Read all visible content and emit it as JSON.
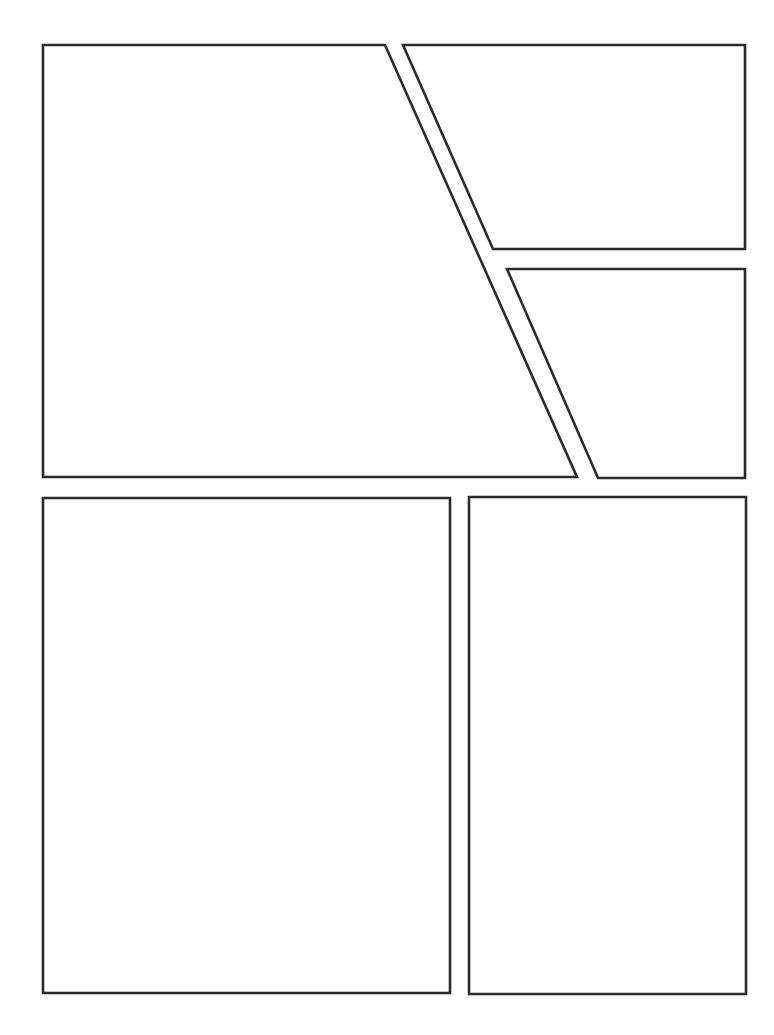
{
  "page": {
    "width": 774,
    "height": 1035,
    "background": "#ffffff",
    "border_color": "#2b2b2b",
    "panel_count": 5
  },
  "panels": [
    {
      "id": "panel-1",
      "points": "43,45 385,45 577,477 43,477"
    },
    {
      "id": "panel-2",
      "points": "403,45 745,45 745,249 493,249"
    },
    {
      "id": "panel-3",
      "points": "507,269 745,269 745,478 598,478"
    },
    {
      "id": "panel-4",
      "points": "43,498 450,498 450,993 43,993"
    },
    {
      "id": "panel-5",
      "points": "469,497 746,497 746,994 469,994"
    }
  ]
}
